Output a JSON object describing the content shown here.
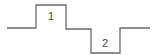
{
  "diagram": {
    "type": "pulse-waveform",
    "colors": {
      "line": "#6a6a6a",
      "label": "#444444",
      "background": "#ffffff"
    },
    "levels": {
      "baseline_y": 28,
      "high_y": 5,
      "low_y": 53
    },
    "waveform_points": "7,28 36,28 36,5 66,5 66,29 91,29 91,53 120,53 120,28 150,28",
    "pulses": [
      {
        "label": "1",
        "direction": "positive",
        "x_start": 36,
        "x_end": 66,
        "label_x": 51,
        "label_y": 20
      },
      {
        "label": "2",
        "direction": "negative",
        "x_start": 91,
        "x_end": 120,
        "label_x": 105,
        "label_y": 47
      }
    ]
  }
}
